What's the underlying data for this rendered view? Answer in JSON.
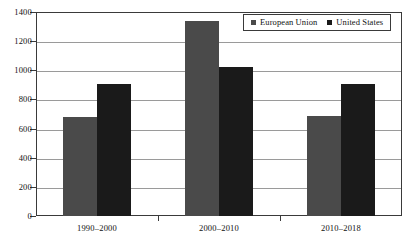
{
  "chart_data": {
    "type": "bar",
    "title": "",
    "subtitle": "",
    "xlabel": "",
    "ylabel": "",
    "categories": [
      "1990–2000",
      "2000–2010",
      "2010–2018"
    ],
    "series": [
      {
        "name": "European Union",
        "values": [
          680,
          1335,
          685
        ],
        "color": "#4a4a4a"
      },
      {
        "name": "United States",
        "values": [
          905,
          1025,
          905
        ],
        "color": "#1a1a1a"
      }
    ],
    "ylim": [
      0,
      1400
    ],
    "yticks": [
      0,
      200,
      400,
      600,
      800,
      1000,
      1200,
      1400
    ],
    "ytick_labels": [
      "0",
      "200",
      "400",
      "600",
      "800",
      "1000",
      "1200",
      "1400"
    ],
    "grid": "horizontal",
    "legend_position": "top-right-inside",
    "annotations": []
  },
  "legend": {
    "items": [
      {
        "label": "European Union",
        "color": "#4a4a4a"
      },
      {
        "label": "United States",
        "color": "#1a1a1a"
      }
    ]
  },
  "colors": {
    "european_union": "#4a4a4a",
    "united_states": "#1a1a1a",
    "gridline": "#9a9a9a",
    "axis": "#3a3a3a",
    "background": "#ffffff"
  }
}
